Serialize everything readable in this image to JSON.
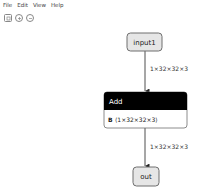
{
  "menu": {
    "items": [
      {
        "label": "File"
      },
      {
        "label": "Edit"
      },
      {
        "label": "View"
      },
      {
        "label": "Help"
      }
    ]
  },
  "toolbar": {
    "buttons": [
      {
        "icon": "fit-to-screen-icon"
      },
      {
        "icon": "zoom-in-icon"
      },
      {
        "icon": "zoom-out-icon"
      }
    ]
  },
  "graph": {
    "nodes": {
      "input1": {
        "label": "input1"
      },
      "add": {
        "title": "Add",
        "attr_name": "B",
        "attr_value": "⟨1×32×32×3⟩"
      },
      "out": {
        "label": "out"
      }
    },
    "edges": [
      {
        "from": "input1",
        "to": "add",
        "label": "1×32×32×3"
      },
      {
        "from": "add",
        "to": "out",
        "label": "1×32×32×3"
      }
    ]
  },
  "colors": {
    "io_fill": "#e6e6e6",
    "io_stroke": "#6e6e6e",
    "op_header": "#000000",
    "op_header_text": "#ffffff",
    "edge": "#222222"
  }
}
